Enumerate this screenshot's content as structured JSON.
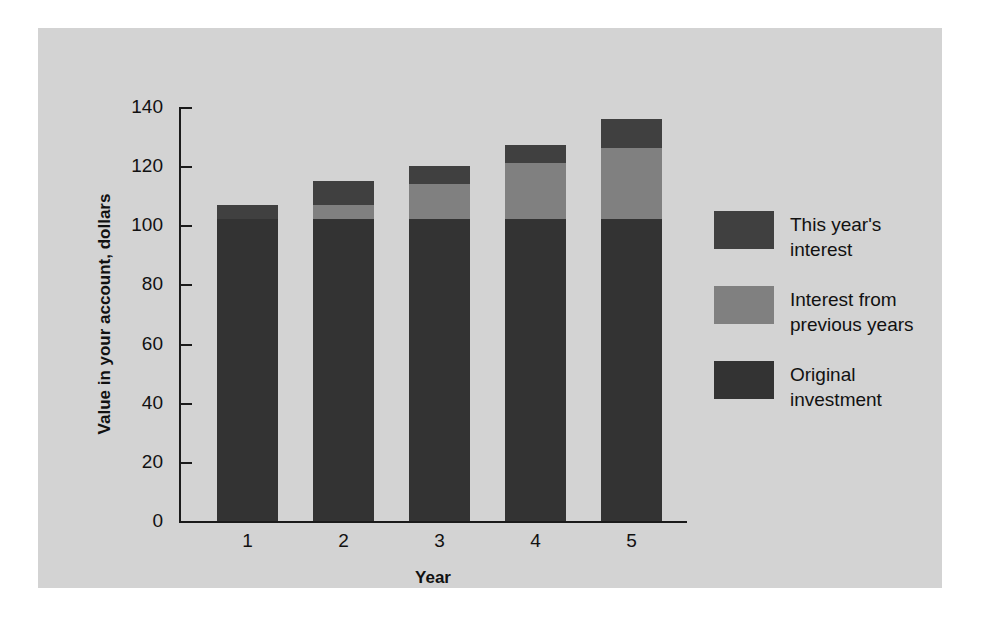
{
  "chart_data": {
    "type": "bar",
    "subtype": "stacked-vertical",
    "title": "",
    "xlabel": "Year",
    "ylabel": "Value in your account, dollars",
    "categories": [
      "1",
      "2",
      "3",
      "4",
      "5"
    ],
    "x_tick_labels": [
      "1",
      "2",
      "3",
      "4",
      "5"
    ],
    "y_tick_labels": [
      "0",
      "20",
      "40",
      "60",
      "80",
      "100",
      "120",
      "140"
    ],
    "y_ticks": [
      0,
      20,
      40,
      60,
      80,
      100,
      120,
      140
    ],
    "ylim": [
      0,
      140
    ],
    "grid": false,
    "legend_position": "right",
    "series": [
      {
        "name": "Original investment",
        "color": "#333333",
        "values": [
          102,
          102,
          102,
          102,
          102
        ]
      },
      {
        "name": "Interest from previous years",
        "color": "#808080",
        "values": [
          0,
          5,
          12,
          19,
          24
        ]
      },
      {
        "name": "This year's interest",
        "color": "#404040",
        "values": [
          5,
          8,
          6,
          6,
          10
        ]
      }
    ],
    "totals": [
      107,
      115,
      120,
      127,
      136
    ]
  },
  "axes": {
    "y_label": "Value in your account, dollars",
    "x_label": "Year",
    "y_tick_labels": [
      "140",
      "120",
      "100",
      "80",
      "60",
      "40",
      "20",
      "0"
    ],
    "x_tick_labels": [
      "1",
      "2",
      "3",
      "4",
      "5"
    ]
  },
  "legend": {
    "items": [
      {
        "color": "#404040",
        "line1": "This year's",
        "line2": "interest"
      },
      {
        "color": "#808080",
        "line1": "Interest from",
        "line2": "previous years"
      },
      {
        "color": "#333333",
        "line1": "Original",
        "line2": "investment"
      }
    ]
  },
  "colors": {
    "page_background": "#ffffff",
    "panel_background": "#d3d3d3",
    "axis": "#1a1a1a",
    "text": "#111111",
    "this_year_interest": "#404040",
    "previous_interest": "#808080",
    "original_investment": "#333333"
  }
}
